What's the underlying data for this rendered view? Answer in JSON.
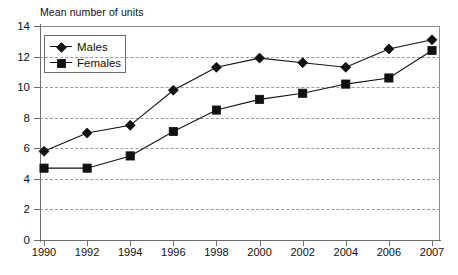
{
  "chart_data": {
    "type": "line",
    "title": "Mean number of units",
    "xlabel": "",
    "ylabel": "",
    "categories": [
      "1990",
      "1992",
      "1994",
      "1996",
      "1998",
      "2000",
      "2002",
      "2004",
      "2006",
      "2007"
    ],
    "series": [
      {
        "name": "Males",
        "marker": "diamond",
        "values": [
          5.8,
          7.0,
          7.5,
          9.8,
          11.3,
          11.9,
          11.6,
          11.3,
          12.5,
          13.1
        ]
      },
      {
        "name": "Females",
        "marker": "square",
        "values": [
          4.7,
          4.7,
          5.5,
          7.1,
          8.5,
          9.2,
          9.6,
          10.2,
          10.6,
          12.4
        ]
      }
    ],
    "ylim": [
      0,
      14
    ],
    "yticks": [
      0,
      2,
      4,
      6,
      8,
      10,
      12,
      14
    ],
    "ytick_labels": [
      "0",
      "2",
      "4",
      "6",
      "8",
      "10",
      "12",
      "14"
    ],
    "grid": true,
    "grid_axis": "y",
    "grid_style": "dashed",
    "legend_position": "top-left",
    "colors": {
      "line": "#111111",
      "marker": "#111111",
      "grid": "#9a9a9a",
      "axis": "#6e6e6e",
      "background": "#ffffff"
    }
  }
}
